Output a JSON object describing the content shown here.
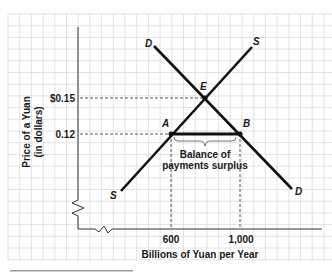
{
  "chart_data": {
    "type": "line",
    "title": "",
    "xlabel": "Billions of Yuan per Year",
    "ylabel": "Price of a Yuan",
    "ylabel_sub": "(in dollars)",
    "y_ticks": [
      {
        "label": "$0.15",
        "value": 0.15
      },
      {
        "label": "0.12",
        "value": 0.12
      }
    ],
    "x_ticks": [
      {
        "label": "600",
        "value": 600
      },
      {
        "label": "1,000",
        "value": 1000
      }
    ],
    "series": [
      {
        "name": "D",
        "label_start": "D",
        "label_end": "D",
        "kind": "demand",
        "points": [
          [
            450,
            0.175
          ],
          [
            1250,
            0.09
          ]
        ]
      },
      {
        "name": "S",
        "label_start": "S",
        "label_end": "S",
        "kind": "supply",
        "points": [
          [
            300,
            0.08
          ],
          [
            1070,
            0.175
          ]
        ]
      }
    ],
    "points": [
      {
        "name": "E",
        "label": "E",
        "x": 800,
        "y": 0.15,
        "description": "equilibrium"
      },
      {
        "name": "A",
        "label": "A",
        "x": 600,
        "y": 0.12
      },
      {
        "name": "B",
        "label": "B",
        "x": 1000,
        "y": 0.12
      }
    ],
    "annotations": [
      {
        "text_line1": "Balance of",
        "text_line2": "payments surplus",
        "from": "A",
        "to": "B"
      }
    ],
    "grid": true,
    "axis_breaks": true
  },
  "labels": {
    "ylabel_line1": "Price of a Yuan",
    "ylabel_line2": "(in dollars)",
    "xlabel": "Billions of Yuan per Year",
    "ytick_high": "$0.15",
    "ytick_low": "0.12",
    "xtick_left": "600",
    "xtick_right": "1,000",
    "D_top": "D",
    "D_bottom": "D",
    "S_top": "S",
    "S_bottom": "S",
    "E": "E",
    "A": "A",
    "B": "B",
    "surplus_line1": "Balance of",
    "surplus_line2": "payments surplus"
  },
  "colors": {
    "grid": "#dcdcdc",
    "curve": "#111111",
    "axis": "#333333",
    "dashed": "#444444",
    "bottom_bar": "#9a9a9a"
  }
}
